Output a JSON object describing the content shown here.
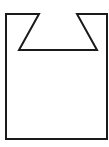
{
  "diagram": {
    "stroke_color": "#1a1a1a",
    "background_color": "#ffffff",
    "stroke_width": 2,
    "outline_points": "6,14 39,14 19,50 97,50 77,14 107,14 107,139 6,139"
  }
}
